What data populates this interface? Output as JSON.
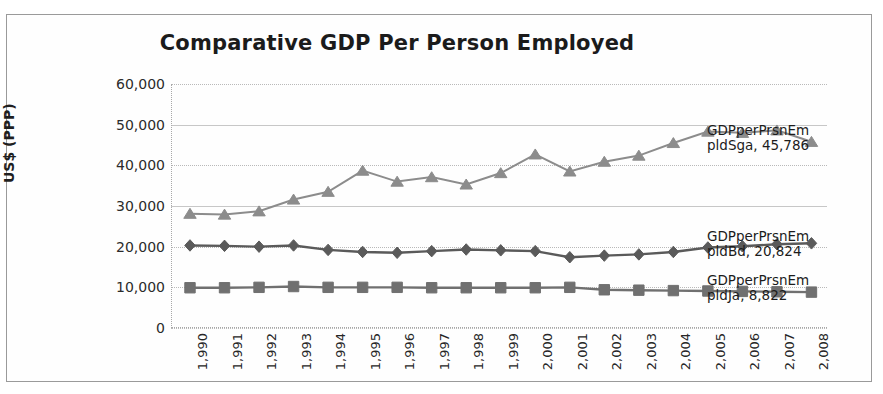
{
  "chart_data": {
    "type": "line",
    "title": "Comparative GDP Per Person Employed",
    "xlabel": "",
    "ylabel": "US$ (PPP)",
    "ylim": [
      0,
      60000
    ],
    "ytick_values": [
      60000,
      50000,
      40000,
      30000,
      20000,
      10000,
      0
    ],
    "ytick_labels": [
      "60,000",
      "50,000",
      "40,000",
      "30,000",
      "20,000",
      "10,000",
      "0"
    ],
    "grid": true,
    "legend": "none",
    "x": [
      1990,
      1991,
      1992,
      1993,
      1994,
      1995,
      1996,
      1997,
      1998,
      1999,
      2000,
      2001,
      2002,
      2003,
      2004,
      2005,
      2006,
      2007,
      2008
    ],
    "xtick_labels": [
      "1,990",
      "1,991",
      "1,992",
      "1,993",
      "1,994",
      "1,995",
      "1,996",
      "1,997",
      "1,998",
      "1,999",
      "2,000",
      "2,001",
      "2,002",
      "2,003",
      "2,004",
      "2,005",
      "2,006",
      "2,007",
      "2,008"
    ],
    "series": [
      {
        "name": "GDPperPrsnEmpldSga",
        "marker": "triangle",
        "color": "#8c8c8c",
        "end_label": "GDPperPrsnEm\npldSga, 45,786",
        "end_label_line1": "GDPperPrsnEm",
        "end_label_line2": "pldSga, 45,786",
        "end_value": 45786,
        "values": [
          28100,
          27900,
          28700,
          31600,
          33500,
          38700,
          36000,
          37100,
          35300,
          38100,
          42700,
          38500,
          40900,
          42400,
          45500,
          48300,
          48000,
          48600,
          45786
        ]
      },
      {
        "name": "GDPperPrsnEmpldBd",
        "marker": "diamond",
        "color": "#5a5a5a",
        "end_label": "GDPperPrsnEm\npldBd, 20,824",
        "end_label_line1": "GDPperPrsnEm",
        "end_label_line2": "pldBd, 20,824",
        "end_value": 20824,
        "values": [
          20300,
          20200,
          20000,
          20300,
          19200,
          18700,
          18500,
          18900,
          19300,
          19100,
          18900,
          17400,
          17800,
          18100,
          18700,
          19800,
          20100,
          20600,
          20824
        ]
      },
      {
        "name": "GDPperPrsnEmpldJa",
        "marker": "square",
        "color": "#707070",
        "end_label": "GDPperPrsnEm\npldJa, 8,822",
        "end_label_line1": "GDPperPrsnEm",
        "end_label_line2": "pldJa, 8,822",
        "end_value": 8822,
        "values": [
          9900,
          9900,
          10000,
          10200,
          10000,
          10000,
          10000,
          9900,
          9900,
          9900,
          9900,
          10000,
          9400,
          9300,
          9200,
          9100,
          9000,
          8900,
          8822
        ]
      }
    ]
  }
}
